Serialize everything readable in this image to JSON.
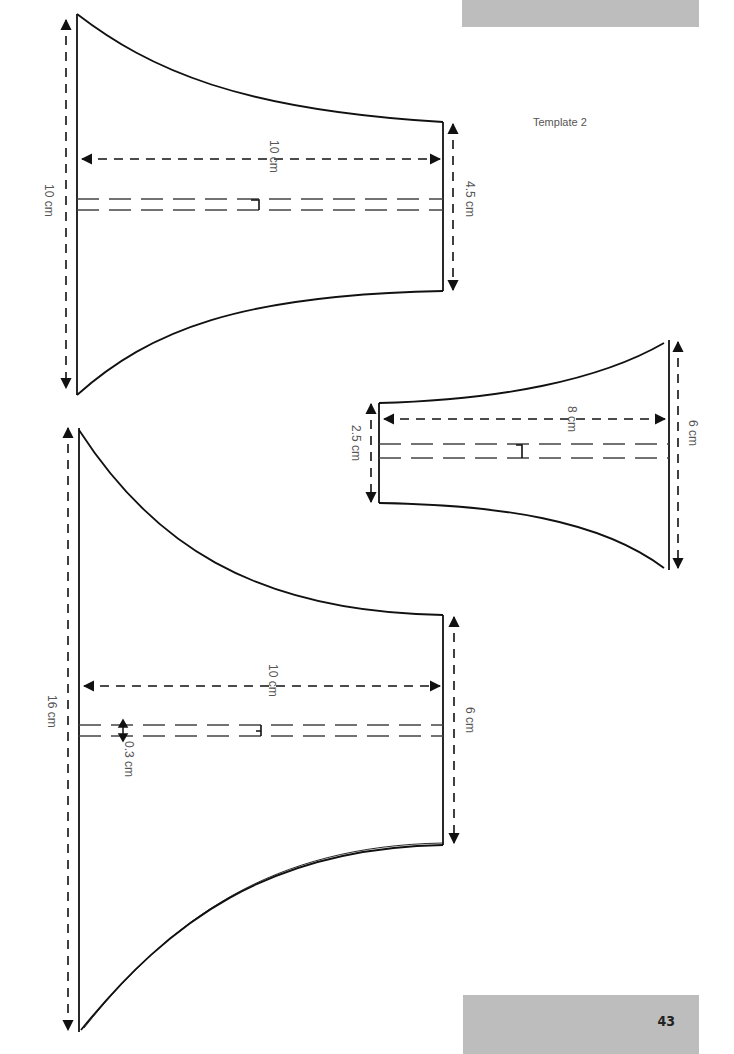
{
  "page": {
    "template_label": "Template 2",
    "page_number": "43",
    "tab_color": "#bdbdbd"
  },
  "shapes": [
    {
      "name": "large-top-template",
      "labels": {
        "height": "10 cm",
        "width": "10 cm",
        "neck": "4.5 cm"
      }
    },
    {
      "name": "small-template",
      "labels": {
        "neck": "2.5 cm",
        "width": "8 cm",
        "height": "6 cm"
      }
    },
    {
      "name": "large-bottom-template",
      "labels": {
        "height": "16 cm",
        "width": "10 cm",
        "neck": "6 cm",
        "seam": "0.3 cm"
      }
    }
  ]
}
